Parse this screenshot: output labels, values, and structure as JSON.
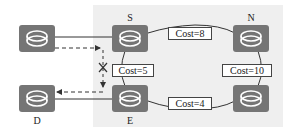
{
  "diagram": {
    "type": "network-topology",
    "nodes": [
      {
        "id": "src",
        "label": ""
      },
      {
        "id": "S",
        "label": "S"
      },
      {
        "id": "N",
        "label": "N"
      },
      {
        "id": "D",
        "label": "D"
      },
      {
        "id": "E",
        "label": "E"
      },
      {
        "id": "R",
        "label": ""
      }
    ],
    "links": [
      {
        "from": "S",
        "to": "N",
        "cost": "Cost=8"
      },
      {
        "from": "S",
        "to": "E",
        "cost": "Cost=5"
      },
      {
        "from": "N",
        "to": "R",
        "cost": "Cost=10"
      },
      {
        "from": "E",
        "to": "R",
        "cost": "Cost=4"
      }
    ],
    "failed_path_marker": "X",
    "colors": {
      "router_fill": "#757575",
      "region_fill": "#efefef",
      "line": "#333333"
    }
  }
}
